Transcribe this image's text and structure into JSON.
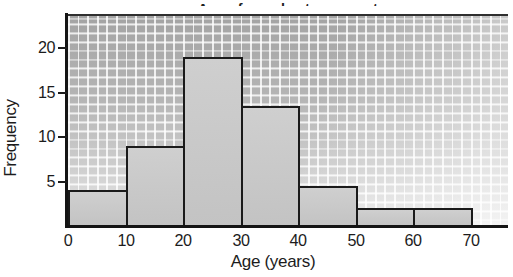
{
  "chart_data": {
    "type": "bar",
    "subtype": "histogram",
    "title": "Age of people at a concert",
    "title_note": "title clipped at top edge of screenshot",
    "xlabel": "Age (years)",
    "ylabel": "Frequency",
    "bin_edges": [
      0,
      10,
      20,
      30,
      40,
      50,
      60,
      70
    ],
    "values": [
      4,
      9,
      19,
      13.5,
      4.5,
      2,
      2
    ],
    "x_ticks": [
      "0",
      "10",
      "20",
      "30",
      "40",
      "50",
      "60",
      "70"
    ],
    "y_ticks": [
      5,
      10,
      15,
      20
    ],
    "ylim": [
      0,
      23.8
    ],
    "xlim": [
      0,
      76.5
    ],
    "grid": "on",
    "legend": "none",
    "colors": {
      "bar_fill": "#c6c6c6",
      "bar_border": "#1a1a1a",
      "axis": "#141414",
      "grid_line": "#ffffff",
      "plot_bg_top": "#a4a4a4",
      "plot_bg_bottom": "#eaeaea",
      "text": "#1c1c1c"
    }
  }
}
